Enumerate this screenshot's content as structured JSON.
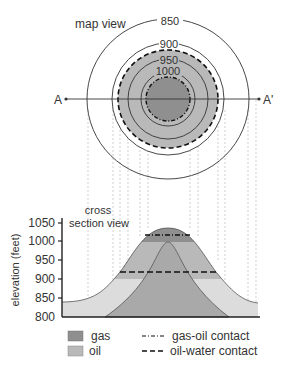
{
  "map_view": {
    "title": "map view",
    "contours": [
      {
        "label": "850",
        "rx": 81,
        "ry": 80
      },
      {
        "label": "900",
        "rx": 56,
        "ry": 56
      },
      {
        "label": "950",
        "rx": 40,
        "ry": 40
      },
      {
        "label": "1000",
        "rx": 27,
        "ry": 27
      }
    ],
    "section_line": {
      "start_label": "A",
      "end_label": "A'"
    }
  },
  "cross_section": {
    "title_line1": "cross",
    "title_line2": "section view",
    "y_axis_label": "elevation (feet)",
    "y_ticks": [
      "1050",
      "1000",
      "950",
      "900",
      "850",
      "800"
    ]
  },
  "legend": {
    "gas_label": "gas",
    "oil_label": "oil",
    "gas_oil_contact_label": "gas-oil contact",
    "oil_water_contact_label": "oil-water contact"
  },
  "colors": {
    "gas": "#8f8f8f",
    "oil": "#b9b9b9",
    "water_zone": "#dcdcdc",
    "lower_layer": "#a9a9a9",
    "line": "#333333",
    "guide": "#bbbbbb"
  }
}
